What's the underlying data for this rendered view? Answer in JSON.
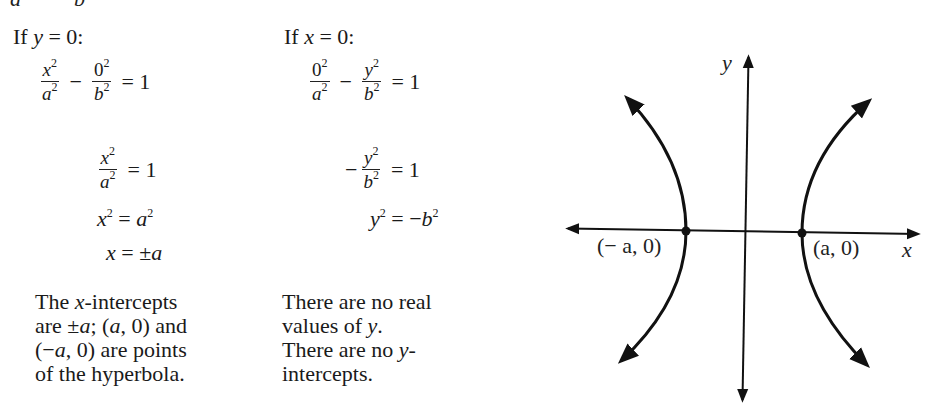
{
  "top_cut": {
    "left_char": "a",
    "right_char": "b"
  },
  "col1": {
    "heading": {
      "prefix": "If ",
      "var": "y",
      "rest": " = 0:"
    },
    "eq1": {
      "frac1_num": "x",
      "frac1_num_exp": "2",
      "frac1_den": "a",
      "frac1_den_exp": "2",
      "op": "−",
      "frac2_num": "0",
      "frac2_num_exp": "2",
      "frac2_den": "b",
      "frac2_den_exp": "2",
      "rhs": "= 1"
    },
    "eq2": {
      "frac_num": "x",
      "frac_num_exp": "2",
      "frac_den": "a",
      "frac_den_exp": "2",
      "rhs": "= 1"
    },
    "eq3": {
      "lhs": "x",
      "lhs_exp": "2",
      "mid": " = ",
      "rhs": "a",
      "rhs_exp": "2"
    },
    "eq4": {
      "lhs": "x",
      "mid": " = ±",
      "rhs": "a"
    },
    "note": {
      "line1_a": "The ",
      "line1_var": "x",
      "line1_b": "-intercepts",
      "line2_a": "are ±",
      "line2_var1": "a",
      "line2_b": "; (",
      "line2_var2": "a",
      "line2_c": ", 0) and",
      "line3_a": "(−",
      "line3_var": "a",
      "line3_b": ", 0) are points",
      "line4": "of the hyperbola."
    }
  },
  "col2": {
    "heading": {
      "prefix": "If ",
      "var": "x",
      "rest": " = 0:"
    },
    "eq1": {
      "frac1_num": "0",
      "frac1_num_exp": "2",
      "frac1_den": "a",
      "frac1_den_exp": "2",
      "op": "−",
      "frac2_num": "y",
      "frac2_num_exp": "2",
      "frac2_den": "b",
      "frac2_den_exp": "2",
      "rhs": "= 1"
    },
    "eq2": {
      "sign": "−",
      "frac_num": "y",
      "frac_num_exp": "2",
      "frac_den": "b",
      "frac_den_exp": "2",
      "rhs": "= 1"
    },
    "eq3": {
      "lhs": "y",
      "lhs_exp": "2",
      "mid": " = −",
      "rhs": "b",
      "rhs_exp": "2"
    },
    "note": {
      "line1": "There are no real",
      "line2_a": "values of ",
      "line2_var": "y",
      "line2_b": ".",
      "line3_a": "There are no ",
      "line3_var": "y",
      "line3_b": "-",
      "line4": "intercepts."
    }
  },
  "graph": {
    "x_axis_label": "x",
    "y_axis_label": "y",
    "left_vertex_label": "(− a, 0)",
    "right_vertex_label": "(a, 0)",
    "curve_color": "#111111",
    "axis_color": "#111111"
  }
}
